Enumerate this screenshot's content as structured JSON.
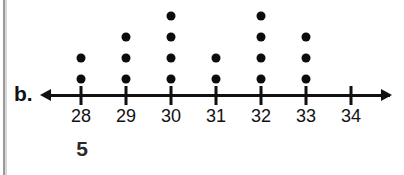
{
  "figure": {
    "part_label": "b.",
    "below_number": "5"
  },
  "chart_data": {
    "type": "scatter",
    "subtype": "dot-plot",
    "title": "",
    "subtitle": "",
    "xlabel": "",
    "ylabel": "",
    "categories": [
      "28",
      "29",
      "30",
      "31",
      "32",
      "33",
      "34"
    ],
    "values": [
      2,
      3,
      4,
      2,
      4,
      3,
      0
    ],
    "x": [
      28,
      29,
      30,
      31,
      32,
      33,
      34
    ],
    "tick_labels": [
      "28",
      "29",
      "30",
      "31",
      "32",
      "33",
      "34"
    ],
    "xlim": [
      27.4,
      34.7
    ],
    "ylim": [
      0,
      4
    ],
    "grid": false,
    "legend": null,
    "axis": {
      "arrow_left": true,
      "arrow_right": true,
      "line_color": "#111111"
    },
    "dot_color": "#0c0c0c",
    "annotations": [
      "b.",
      "5"
    ],
    "data_points": [
      {
        "value": "28",
        "count": 2
      },
      {
        "value": "29",
        "count": 3
      },
      {
        "value": "30",
        "count": 4
      },
      {
        "value": "31",
        "count": 2
      },
      {
        "value": "32",
        "count": 4
      },
      {
        "value": "33",
        "count": 3
      },
      {
        "value": "34",
        "count": 0
      }
    ]
  },
  "colors": {
    "background": "#ffffff",
    "ink": "#111111",
    "page_edge": "#9a9a9a"
  }
}
